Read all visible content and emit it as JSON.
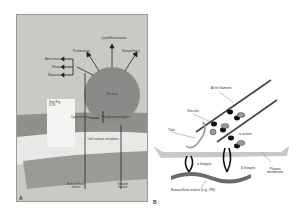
{
  "panel_a": {
    "letter": "A",
    "nucleus_label": "Nucleus",
    "outputs": {
      "proliferation": "Proliferation",
      "cytodifferentiation": "Cytodifferentiation",
      "biosynthesis": "Biosynthesis",
      "attachment": "Attachment",
      "shape": "Shape",
      "migration": "Migration"
    },
    "cytoskeleton": "Cytoskeleton",
    "soluble_messengers": "Soluble messengers",
    "see_fig": "See Fig.\n3-19",
    "cell_surface_receptors": "Cell surface receptors",
    "extracellular_matrix": "Extracellular\nmatrix",
    "growth_factors": "Growth\nfactors",
    "colors": {
      "background": "#c9c9c6",
      "nucleus": "#8a8a88",
      "receptor_band": "#8f8f8c",
      "matrix_band": "#9a9a97",
      "light_band": "#e8e8e6"
    }
  },
  "panel_b": {
    "letter": "B",
    "labels": {
      "actin_filament": "Actin filament",
      "vinculin": "Vinculin",
      "talin": "Talin",
      "alpha_actinin": "α actinin",
      "alpha_integrin": "α Integrin",
      "beta_integrin": "β Integrin",
      "plasma_membrane": "Plasma\nmembrane",
      "extracellular_matrix": "Extracellular matrix (e.g., FN)"
    },
    "colors": {
      "membrane": "#c8c8c6",
      "actin": "#444444",
      "matrix": "#6a6a68",
      "integrin": "#1a1a1a"
    }
  }
}
